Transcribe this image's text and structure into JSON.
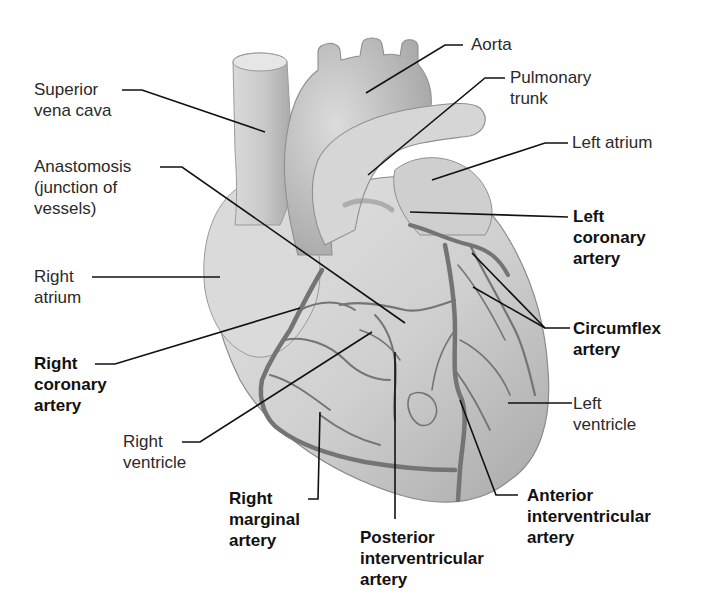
{
  "labels": {
    "superior_vena_cava": {
      "lines": [
        "Superior",
        "vena cava"
      ],
      "bold": false
    },
    "anastomosis": {
      "lines": [
        "Anastomosis",
        "(junction of",
        "vessels)"
      ],
      "bold": false
    },
    "right_atrium": {
      "lines": [
        "Right",
        "atrium"
      ],
      "bold": false
    },
    "right_coronary_artery": {
      "lines": [
        "Right",
        "coronary",
        "artery"
      ],
      "bold": true
    },
    "right_ventricle": {
      "lines": [
        "Right",
        "ventricle"
      ],
      "bold": false
    },
    "right_marginal_artery": {
      "lines": [
        "Right",
        "marginal",
        "artery"
      ],
      "bold": true
    },
    "posterior_interventricular_artery": {
      "lines": [
        "Posterior",
        "interventricular",
        "artery"
      ],
      "bold": true
    },
    "anterior_interventricular_artery": {
      "lines": [
        "Anterior",
        "interventricular",
        "artery"
      ],
      "bold": true
    },
    "left_ventricle": {
      "lines": [
        "Left",
        "ventricle"
      ],
      "bold": false
    },
    "circumflex_artery": {
      "lines": [
        "Circumflex",
        "artery"
      ],
      "bold": true
    },
    "left_coronary_artery": {
      "lines": [
        "Left",
        "coronary",
        "artery"
      ],
      "bold": true
    },
    "left_atrium": {
      "lines": [
        "Left atrium"
      ],
      "bold": false
    },
    "pulmonary_trunk": {
      "lines": [
        "Pulmonary",
        "trunk"
      ],
      "bold": false
    },
    "aorta": {
      "lines": [
        "Aorta"
      ],
      "bold": false
    }
  },
  "colors": {
    "background": "#ffffff",
    "heart_fill": "#c9c9c9",
    "vessel_stroke": "#6e6e6e",
    "leader_line": "#111111",
    "text": "#222222"
  }
}
